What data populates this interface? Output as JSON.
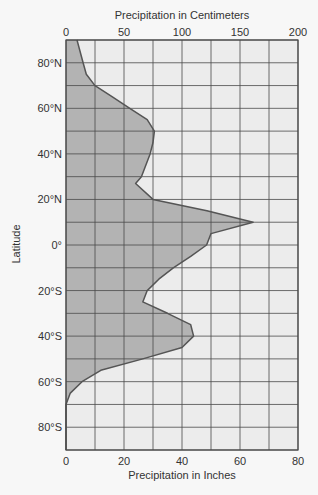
{
  "chart_data": {
    "type": "area",
    "orientation": "horizontal",
    "title_top": "Precipitation in Centimeters",
    "xlabel": "Precipitation in Inches",
    "ylabel": "Latitude",
    "x_top_ticks": [
      "0",
      "50",
      "100",
      "150",
      "200"
    ],
    "x_bottom_ticks": [
      "0",
      "20",
      "40",
      "60",
      "80"
    ],
    "y_ticks": [
      "80°N",
      "60°N",
      "40°N",
      "20°N",
      "0°",
      "20°S",
      "40°S",
      "60°S",
      "80°S"
    ],
    "xlim_inches": [
      0,
      80
    ],
    "xlim_cm": [
      0,
      200
    ],
    "ylim_latitude": [
      -90,
      90
    ],
    "grid": true,
    "series": [
      {
        "name": "Precipitation",
        "latitude": [
          90,
          80,
          75,
          70,
          65,
          60,
          55,
          50,
          45,
          40,
          35,
          30,
          27,
          20,
          15,
          10,
          5,
          0,
          -5,
          -10,
          -15,
          -20,
          -25,
          -30,
          -35,
          -40,
          -45,
          -50,
          -55,
          -60,
          -65,
          -70,
          -80,
          -90
        ],
        "inches": [
          3.8,
          5.9,
          7,
          10,
          16,
          22,
          28,
          30.5,
          30,
          29,
          27.5,
          26,
          24,
          30,
          48.6,
          64.5,
          50,
          48.5,
          43,
          37,
          32,
          28,
          26.5,
          35,
          43,
          44,
          40,
          26.5,
          12,
          5.5,
          1.5,
          0,
          0,
          0
        ]
      }
    ]
  },
  "colors": {
    "plot_bg": "#ececec",
    "fill": "#b3b3b3",
    "grid": "#4a4a4a",
    "curve": "#555555"
  }
}
